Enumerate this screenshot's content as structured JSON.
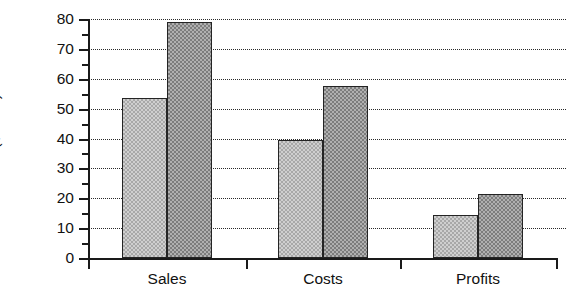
{
  "chart_data": {
    "type": "bar",
    "title": "",
    "subtitle": "",
    "xlabel": "",
    "ylabel": "Dollars  ($1000)",
    "categories": [
      "Sales",
      "Costs",
      "Profits"
    ],
    "series": [
      {
        "name": "Series 1",
        "values": [
          53.5,
          39.5,
          14.5
        ],
        "fill": "#cfcfcf"
      },
      {
        "name": "Series 2",
        "values": [
          79,
          57.5,
          21.5
        ],
        "fill": "#b0b0b0"
      }
    ],
    "ylim": [
      0,
      80
    ],
    "ytick_labels": [
      "0",
      "10",
      "20",
      "30",
      "40",
      "50",
      "60",
      "70",
      "80"
    ],
    "ytick_values": [
      0,
      10,
      20,
      30,
      40,
      50,
      60,
      70,
      80
    ],
    "yminor_values": [
      5,
      15,
      25,
      35,
      45,
      55,
      65,
      75
    ],
    "grid": "horizontal-dotted",
    "legend": "none",
    "axis_color": "#1a1a1a",
    "grid_color": "#2a2a2a",
    "background": "#ffffff"
  }
}
